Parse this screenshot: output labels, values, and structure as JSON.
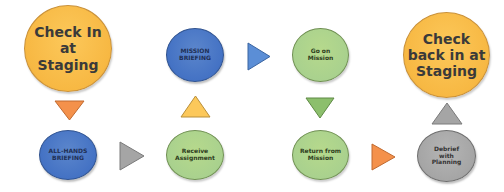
{
  "diagram": {
    "type": "process-flow",
    "nodes": [
      {
        "id": "check-in",
        "lines": [
          "Check In",
          "at",
          "Staging"
        ],
        "color": "#f7b843"
      },
      {
        "id": "all-hands",
        "lines": [
          "ALL-HANDS",
          "BRIEFING"
        ],
        "color": "#4472c4"
      },
      {
        "id": "receive-assignment",
        "lines": [
          "Receive",
          "Assignment"
        ],
        "color": "#a9d18e"
      },
      {
        "id": "mission-briefing",
        "lines": [
          "MISSION",
          "BRIEFING"
        ],
        "color": "#4472c4"
      },
      {
        "id": "go-on-mission",
        "lines": [
          "Go on",
          "Mission"
        ],
        "color": "#a9d18e"
      },
      {
        "id": "return-from-mission",
        "lines": [
          "Return from",
          "Mission"
        ],
        "color": "#a9d18e"
      },
      {
        "id": "debrief",
        "lines": [
          "Debrief",
          "with",
          "Planning"
        ],
        "color": "#a5a5a5"
      },
      {
        "id": "check-back-in",
        "lines": [
          "Check",
          "back in at",
          "Staging"
        ],
        "color": "#f7b843"
      }
    ],
    "arrows": [
      {
        "from": "check-in",
        "to": "all-hands",
        "direction": "down",
        "color": "#f4914b"
      },
      {
        "from": "all-hands",
        "to": "receive-assignment",
        "direction": "right",
        "color": "#a5a5a5"
      },
      {
        "from": "receive-assignment",
        "to": "mission-briefing",
        "direction": "up",
        "color": "#fcc85a"
      },
      {
        "from": "mission-briefing",
        "to": "go-on-mission",
        "direction": "right",
        "color": "#5b8ed6"
      },
      {
        "from": "go-on-mission",
        "to": "return-from-mission",
        "direction": "down",
        "color": "#8cbf6c"
      },
      {
        "from": "return-from-mission",
        "to": "debrief",
        "direction": "right",
        "color": "#f4914b"
      },
      {
        "from": "debrief",
        "to": "check-back-in",
        "direction": "up",
        "color": "#a5a5a5"
      }
    ]
  }
}
